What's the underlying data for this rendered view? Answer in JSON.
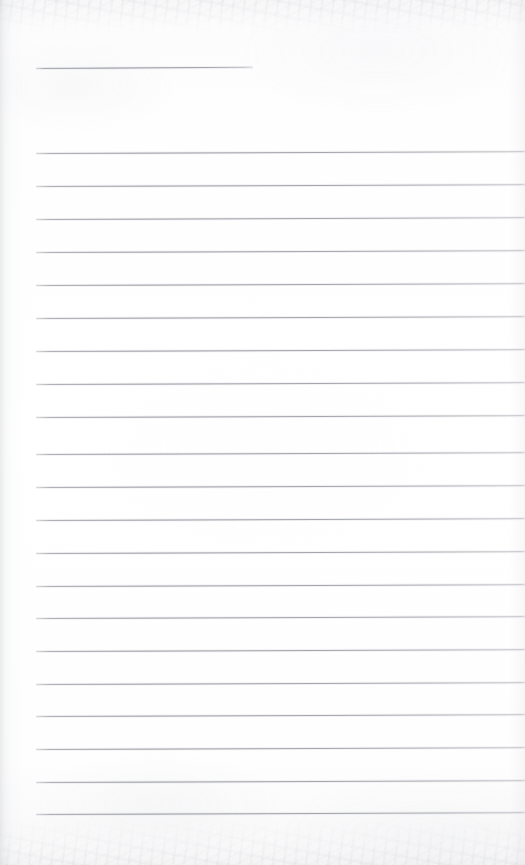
{
  "document": {
    "kind": "scanned-page",
    "description": "Blank ruled notebook page scan",
    "text_content": "",
    "page_width": 525,
    "page_height": 865,
    "paper_color": "#fdfdfd",
    "rule_color": "#8c8f98",
    "edge_shadow_color": "#c4c6ca"
  },
  "ruling": {
    "line_count": 22,
    "full_line_count": 21,
    "line_left_x": 36,
    "line_right_x": 525,
    "line_spacing": 33,
    "first_full_line_y": 153,
    "last_full_line_y": 814,
    "slant_degrees": -0.22,
    "lines": [
      {
        "id": "rule-header",
        "y": 68,
        "left": 36,
        "width": 217,
        "slant": -0.3,
        "variant": "short"
      },
      {
        "id": "rule-1",
        "y": 153,
        "left": 36,
        "width": 489,
        "slant": -0.22,
        "variant": "full"
      },
      {
        "id": "rule-2",
        "y": 186,
        "left": 36,
        "width": 489,
        "slant": -0.22,
        "variant": "full"
      },
      {
        "id": "rule-3",
        "y": 219,
        "left": 36,
        "width": 489,
        "slant": -0.22,
        "variant": "full"
      },
      {
        "id": "rule-4",
        "y": 252,
        "left": 36,
        "width": 489,
        "slant": -0.22,
        "variant": "full"
      },
      {
        "id": "rule-5",
        "y": 285,
        "left": 36,
        "width": 489,
        "slant": -0.22,
        "variant": "full"
      },
      {
        "id": "rule-6",
        "y": 318,
        "left": 36,
        "width": 489,
        "slant": -0.22,
        "variant": "full"
      },
      {
        "id": "rule-7",
        "y": 351,
        "left": 36,
        "width": 489,
        "slant": -0.22,
        "variant": "full"
      },
      {
        "id": "rule-8",
        "y": 384,
        "left": 36,
        "width": 489,
        "slant": -0.22,
        "variant": "full"
      },
      {
        "id": "rule-9",
        "y": 417,
        "left": 36,
        "width": 489,
        "slant": -0.22,
        "variant": "full"
      },
      {
        "id": "rule-10",
        "y": 454,
        "left": 36,
        "width": 489,
        "slant": -0.22,
        "variant": "full"
      },
      {
        "id": "rule-11",
        "y": 487,
        "left": 36,
        "width": 489,
        "slant": -0.22,
        "variant": "full"
      },
      {
        "id": "rule-12",
        "y": 520,
        "left": 36,
        "width": 489,
        "slant": -0.22,
        "variant": "full"
      },
      {
        "id": "rule-13",
        "y": 553,
        "left": 36,
        "width": 489,
        "slant": -0.22,
        "variant": "full"
      },
      {
        "id": "rule-14",
        "y": 586,
        "left": 36,
        "width": 489,
        "slant": -0.22,
        "variant": "full"
      },
      {
        "id": "rule-15",
        "y": 618,
        "left": 36,
        "width": 489,
        "slant": -0.22,
        "variant": "full"
      },
      {
        "id": "rule-16",
        "y": 651,
        "left": 36,
        "width": 489,
        "slant": -0.22,
        "variant": "full"
      },
      {
        "id": "rule-17",
        "y": 684,
        "left": 36,
        "width": 489,
        "slant": -0.22,
        "variant": "full"
      },
      {
        "id": "rule-18",
        "y": 716,
        "left": 36,
        "width": 489,
        "slant": -0.22,
        "variant": "full"
      },
      {
        "id": "rule-19",
        "y": 749,
        "left": 36,
        "width": 489,
        "slant": -0.22,
        "variant": "full"
      },
      {
        "id": "rule-20",
        "y": 782,
        "left": 36,
        "width": 489,
        "slant": -0.22,
        "variant": "full"
      },
      {
        "id": "rule-21",
        "y": 814,
        "left": 36,
        "width": 489,
        "slant": -0.22,
        "variant": "full"
      }
    ]
  }
}
